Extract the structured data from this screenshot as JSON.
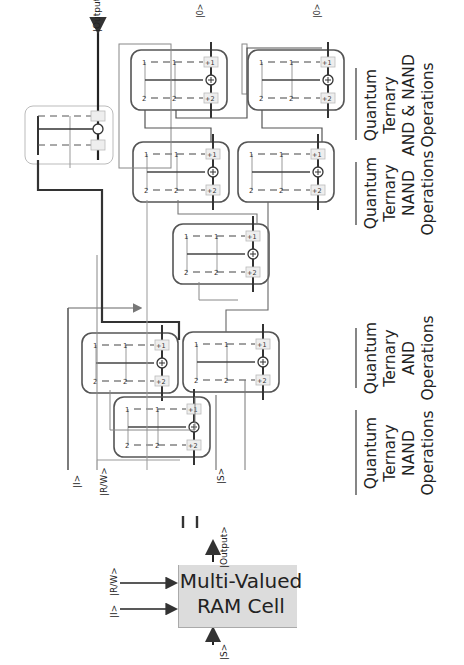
{
  "diagram": {
    "orientation": "rotated -90deg",
    "summary": {
      "box_label_line1": "Multi-Valued",
      "box_label_line2": "RAM Cell",
      "inputs": [
        "|I>",
        "|R/W>"
      ],
      "select_input": "|S>",
      "output": "|Output>",
      "equivalence": "="
    },
    "circuit": {
      "inputs": {
        "i": "|I>",
        "rw": "|R/W>",
        "s": "|S>"
      },
      "output": "|Output>",
      "aux_output_1": "|0>",
      "aux_output_2": "|0>",
      "gate_digits": {
        "top": "1",
        "bottom": "2",
        "plus1": "+1",
        "plus2": "+2",
        "xor": "⊕"
      }
    },
    "groups": [
      {
        "line1": "Quantum",
        "line2": "Ternary",
        "line3": "NAND",
        "line4": "Operations"
      },
      {
        "line1": "Quantum",
        "line2": "Ternary",
        "line3": "AND",
        "line4": "Operations"
      },
      {
        "line1": "Quantum",
        "line2": "Ternary",
        "line3": "NAND",
        "line4": "Operations"
      },
      {
        "line1": "Quantum",
        "line2": "Ternary",
        "line3": "AND & NAND",
        "line4": "Operations"
      }
    ],
    "colors": {
      "line_dark": "#333333",
      "line_light": "#8a8a8a",
      "box_fill": "#dcdcdc",
      "frame": "#555555"
    }
  }
}
